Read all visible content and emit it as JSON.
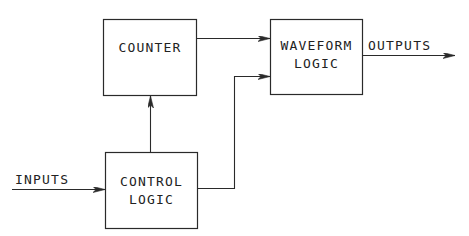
{
  "diagram": {
    "type": "block-diagram",
    "colors": {
      "line": "#2a2a2a",
      "text": "#222222",
      "background": "#ffffff"
    },
    "blocks": [
      {
        "id": "counter",
        "lines": [
          "COUNTER"
        ]
      },
      {
        "id": "waveform_logic",
        "lines": [
          "WAVEFORM",
          "LOGIC"
        ]
      },
      {
        "id": "control_logic",
        "lines": [
          "CONTROL",
          "LOGIC"
        ]
      }
    ],
    "io": {
      "inputs_label": "INPUTS",
      "outputs_label": "OUTPUTS"
    },
    "connections": [
      {
        "from": "inputs",
        "to": "control_logic"
      },
      {
        "from": "control_logic",
        "to": "counter"
      },
      {
        "from": "control_logic",
        "to": "waveform_logic"
      },
      {
        "from": "counter",
        "to": "waveform_logic"
      },
      {
        "from": "waveform_logic",
        "to": "outputs"
      }
    ]
  }
}
